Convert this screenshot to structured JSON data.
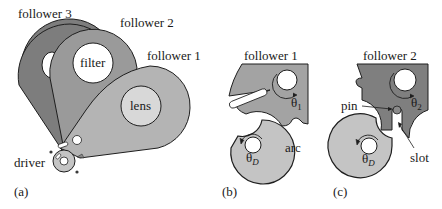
{
  "figure": {
    "panels": [
      {
        "id": "a",
        "label": "(a)",
        "parts": {
          "follower3": "follower 3",
          "follower2": "follower 2",
          "follower1": "follower 1",
          "filter": "filter",
          "lens": "lens",
          "driver": "driver"
        }
      },
      {
        "id": "b",
        "label": "(b)",
        "parts": {
          "follower": "follower 1",
          "theta_follower": "θ",
          "theta_follower_sub": "1",
          "theta_driver": "θ",
          "theta_driver_sub": "D",
          "arc": "arc"
        }
      },
      {
        "id": "c",
        "label": "(c)",
        "parts": {
          "follower": "follower 2",
          "theta_follower": "θ",
          "theta_follower_sub": "2",
          "theta_driver": "θ",
          "theta_driver_sub": "D",
          "pin": "pin",
          "slot": "slot"
        }
      }
    ],
    "colors": {
      "follower3_fill": "#7d7d7d",
      "follower2_fill": "#9a9a9a",
      "follower1_fill": "#b4b4b4",
      "driver_fill": "#c4c4c4",
      "lens_fill": "#d8d8d8",
      "hole_fill": "#ffffff",
      "stroke": "#1e1e1e",
      "panel_b_follower_fill": "#a3a3a3",
      "panel_c_follower_fill": "#7f7f7f"
    }
  }
}
